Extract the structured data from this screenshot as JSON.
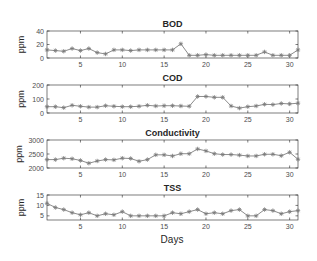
{
  "figure": {
    "xlabel": "Days",
    "series_color": "#8c8c8c"
  },
  "chart_data": [
    {
      "type": "line",
      "title": "BOD",
      "xlabel": "",
      "ylabel": "ppm",
      "xlim": [
        1,
        31
      ],
      "ylim": [
        0,
        40
      ],
      "xticks": [
        5,
        10,
        15,
        20,
        25,
        30
      ],
      "yticks": [
        0,
        20,
        40
      ],
      "grid": false,
      "marker": "asterisk",
      "x": [
        1,
        2,
        3,
        4,
        5,
        6,
        7,
        8,
        9,
        10,
        11,
        12,
        13,
        14,
        15,
        16,
        17,
        18,
        19,
        20,
        21,
        22,
        23,
        24,
        25,
        26,
        27,
        28,
        29,
        30,
        31
      ],
      "values": [
        12,
        11,
        10,
        14,
        11,
        14,
        8,
        6,
        12,
        12,
        11,
        12,
        12,
        12,
        12,
        12,
        21,
        4,
        4,
        5,
        4,
        4,
        4,
        4,
        4,
        4,
        9,
        4,
        4,
        4,
        12
      ]
    },
    {
      "type": "line",
      "title": "COD",
      "xlabel": "",
      "ylabel": "ppm",
      "xlim": [
        1,
        31
      ],
      "ylim": [
        0,
        200
      ],
      "xticks": [
        5,
        10,
        15,
        20,
        25,
        30
      ],
      "yticks": [
        0,
        100,
        200
      ],
      "grid": false,
      "marker": "asterisk",
      "x": [
        1,
        2,
        3,
        4,
        5,
        6,
        7,
        8,
        9,
        10,
        11,
        12,
        13,
        14,
        15,
        16,
        17,
        18,
        19,
        20,
        21,
        22,
        23,
        24,
        25,
        26,
        27,
        28,
        29,
        30,
        31
      ],
      "values": [
        45,
        45,
        38,
        55,
        48,
        42,
        42,
        52,
        48,
        45,
        45,
        48,
        55,
        50,
        52,
        52,
        50,
        48,
        118,
        118,
        112,
        112,
        50,
        35,
        45,
        50,
        62,
        60,
        68,
        65,
        70
      ]
    },
    {
      "type": "line",
      "title": "Conductivity",
      "xlabel": "",
      "ylabel": "ppm",
      "xlim": [
        1,
        31
      ],
      "ylim": [
        2000,
        3000
      ],
      "xticks": [
        5,
        10,
        15,
        20,
        25,
        30
      ],
      "yticks": [
        2000,
        2500,
        3000
      ],
      "grid": false,
      "marker": "asterisk",
      "x": [
        1,
        2,
        3,
        4,
        5,
        6,
        7,
        8,
        9,
        10,
        11,
        12,
        13,
        14,
        15,
        16,
        17,
        18,
        19,
        20,
        21,
        22,
        23,
        24,
        25,
        26,
        27,
        28,
        29,
        30,
        31
      ],
      "values": [
        2300,
        2300,
        2350,
        2330,
        2270,
        2170,
        2250,
        2300,
        2290,
        2350,
        2340,
        2240,
        2300,
        2470,
        2470,
        2430,
        2510,
        2510,
        2680,
        2610,
        2510,
        2480,
        2480,
        2460,
        2430,
        2430,
        2490,
        2490,
        2440,
        2560,
        2310
      ]
    },
    {
      "type": "line",
      "title": "TSS",
      "xlabel": "Days",
      "ylabel": "ppm",
      "xlim": [
        1,
        31
      ],
      "ylim": [
        3,
        15
      ],
      "xticks": [
        5,
        10,
        15,
        20,
        25,
        30
      ],
      "yticks": [
        5,
        10,
        15
      ],
      "grid": false,
      "marker": "asterisk",
      "x": [
        1,
        2,
        3,
        4,
        5,
        6,
        7,
        8,
        9,
        10,
        11,
        12,
        13,
        14,
        15,
        16,
        17,
        18,
        19,
        20,
        21,
        22,
        23,
        24,
        25,
        26,
        27,
        28,
        29,
        30,
        31
      ],
      "values": [
        11,
        9,
        8,
        6.5,
        5.5,
        6.5,
        5,
        6,
        5.5,
        7,
        5,
        5,
        5,
        5,
        5,
        6.5,
        6,
        7,
        8,
        6,
        6.5,
        6,
        7.5,
        8,
        5,
        5,
        8,
        7.5,
        6,
        7,
        7.5
      ]
    }
  ]
}
